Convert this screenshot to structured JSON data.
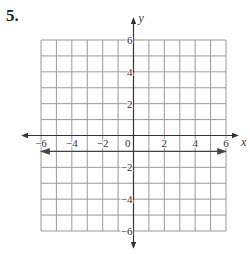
{
  "problem": {
    "number": "5."
  },
  "chart_data": {
    "type": "line",
    "title": "",
    "xlabel": "x",
    "ylabel": "y",
    "xlim": [
      -6,
      6
    ],
    "ylim": [
      -6,
      6
    ],
    "grid": true,
    "grid_step": 1,
    "x_ticks": [
      -6,
      -4,
      -2,
      0,
      2,
      4,
      6
    ],
    "x_tick_labels": [
      "−6",
      "−4",
      "−2",
      "0",
      "2",
      "4",
      "6"
    ],
    "y_ticks": [
      6,
      4,
      2,
      -2,
      -4,
      -6
    ],
    "y_tick_labels": [
      "6",
      "4",
      "2",
      "−2",
      "−4",
      "−6"
    ],
    "series": [
      {
        "name": "line",
        "equation": "y = -1",
        "x": [
          -6,
          6
        ],
        "y": [
          -1,
          -1
        ],
        "arrows": "both"
      }
    ],
    "legend": null
  },
  "colors": {
    "grid": "#9a9a9a",
    "axis": "#333333",
    "line": "#444444"
  }
}
